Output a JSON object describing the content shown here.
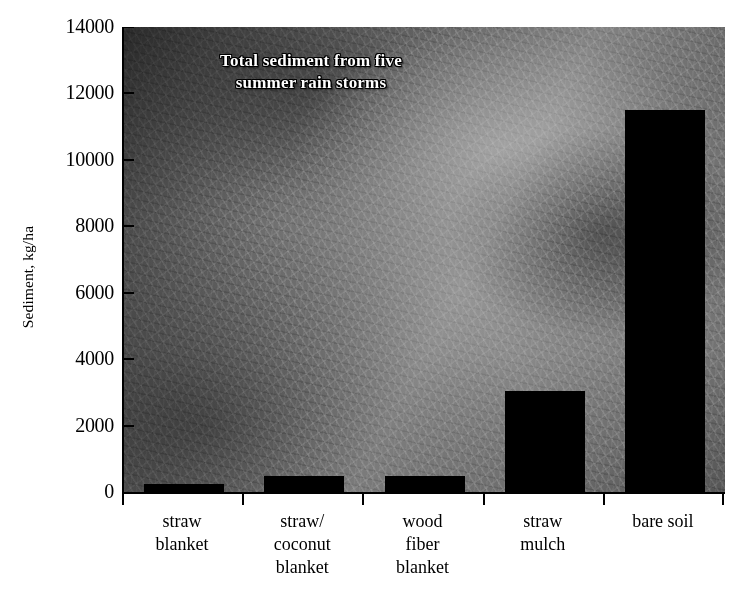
{
  "chart_data": {
    "type": "bar",
    "title": "Total sediment from five summer rain storms",
    "title_line1": "Total sediment from five",
    "title_line2": "summer rain storms",
    "xlabel": "",
    "ylabel": "Sediment, kg/ha",
    "ylim": [
      0,
      14000
    ],
    "ytick_step": 2000,
    "grid": false,
    "legend": false,
    "bar_color": "#000000",
    "categories": [
      "straw blanket",
      "straw/ coconut blanket",
      "wood fiber blanket",
      "straw mulch",
      "bare soil"
    ],
    "category_lines": [
      [
        "straw",
        "blanket"
      ],
      [
        "straw/",
        "coconut",
        "blanket"
      ],
      [
        "wood",
        "fiber",
        "blanket"
      ],
      [
        "straw",
        "mulch"
      ],
      [
        "bare soil"
      ]
    ],
    "values": [
      240,
      480,
      480,
      3050,
      11500
    ],
    "yticks": [
      "0",
      "2000",
      "4000",
      "6000",
      "8000",
      "10000",
      "12000",
      "14000"
    ],
    "ytick_values": [
      0,
      2000,
      4000,
      6000,
      8000,
      10000,
      12000,
      14000
    ],
    "background": "grayscale photograph of straw / fiber erosion-control matting over soil"
  }
}
